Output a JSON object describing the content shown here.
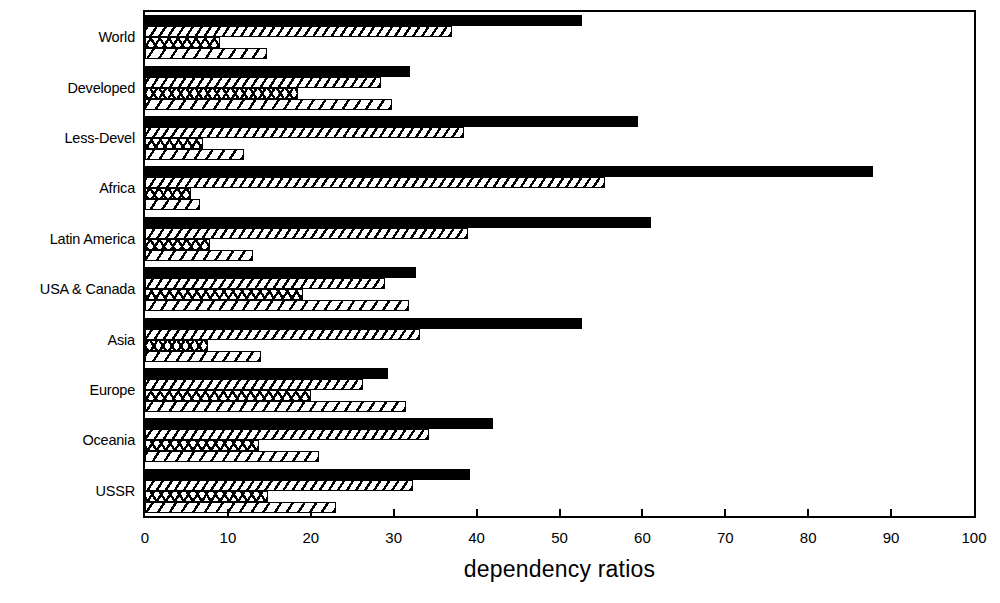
{
  "chart_data": {
    "type": "bar",
    "orientation": "horizontal",
    "title": "",
    "xlabel": "dependency ratios",
    "ylabel": "",
    "xlim": [
      0,
      100
    ],
    "xticks": [
      0,
      10,
      20,
      30,
      40,
      50,
      60,
      70,
      80,
      90,
      100
    ],
    "grid": false,
    "legend": "none",
    "categories": [
      "World",
      "Developed",
      "Less-Devel",
      "Africa",
      "Latin America",
      "USA & Canada",
      "Asia",
      "Europe",
      "Oceania",
      "USSR"
    ],
    "series": [
      {
        "name": "series-1",
        "pattern": "solid-black",
        "values": [
          52.7,
          32.0,
          59.5,
          87.8,
          61.0,
          32.7,
          52.7,
          29.3,
          42.0,
          39.2
        ]
      },
      {
        "name": "series-2",
        "pattern": "diagonal-hatch",
        "values": [
          37.0,
          28.5,
          38.5,
          55.5,
          39.0,
          29.0,
          33.2,
          26.3,
          34.3,
          32.3
        ]
      },
      {
        "name": "series-3",
        "pattern": "cross-hatch",
        "values": [
          9.0,
          18.5,
          7.0,
          5.5,
          7.8,
          19.0,
          7.6,
          20.0,
          13.8,
          14.8
        ]
      },
      {
        "name": "series-4",
        "pattern": "wide-diagonal-hatch",
        "values": [
          14.7,
          29.8,
          12.0,
          6.6,
          13.0,
          31.8,
          14.0,
          31.5,
          21.0,
          23.0
        ]
      }
    ]
  }
}
